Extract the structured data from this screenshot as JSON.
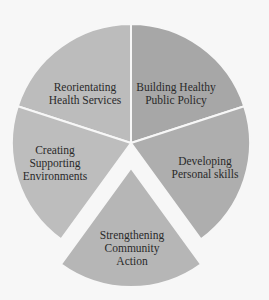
{
  "diagram": {
    "type": "exploded-pie",
    "center": [
      131,
      143
    ],
    "radius": 119,
    "segments": [
      {
        "id": "reorientating",
        "label_lines": [
          "Reorientating",
          "Health Services"
        ],
        "color": "#bcbcbc",
        "start_deg": -72,
        "end_deg": 0,
        "offset": 0,
        "label_pos": [
          85,
          94
        ]
      },
      {
        "id": "building",
        "label_lines": [
          "Building Healthy",
          "Public Policy"
        ],
        "color": "#a7a7a7",
        "start_deg": 0,
        "end_deg": 72,
        "offset": 0,
        "label_pos": [
          176,
          94
        ]
      },
      {
        "id": "developing",
        "label_lines": [
          "Developing",
          "Personal skills"
        ],
        "color": "#aeaeae",
        "start_deg": 72,
        "end_deg": 144,
        "offset": 0,
        "label_pos": [
          205,
          168
        ]
      },
      {
        "id": "strengthening",
        "label_lines": [
          "Strengthening",
          "Community",
          "Action"
        ],
        "color": "#b6b6b6",
        "start_deg": 144,
        "end_deg": 216,
        "offset": 25,
        "label_pos": [
          132,
          248
        ]
      },
      {
        "id": "creating",
        "label_lines": [
          "Creating",
          "Supporting",
          "Environments"
        ],
        "color": "#bdbdbd",
        "start_deg": 216,
        "end_deg": 288,
        "offset": 0,
        "label_pos": [
          55,
          163
        ]
      }
    ],
    "labels": {
      "reorientating": "Reorientating\nHealth Services",
      "building": "Building Healthy\nPublic Policy",
      "developing": "Developing\nPersonal skills",
      "strengthening": "Strengthening\nCommunity\nAction",
      "creating": "Creating\nSupporting\nEnvironments"
    }
  }
}
